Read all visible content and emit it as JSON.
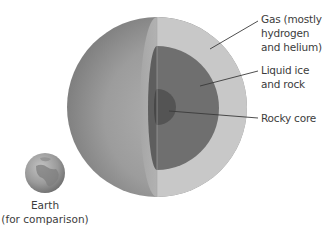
{
  "diagram": {
    "labels": {
      "gas": [
        "Gas (mostly",
        "hydrogen",
        "and helium)"
      ],
      "liquid": [
        "Liquid ice",
        "and rock"
      ],
      "core": [
        "Rocky core"
      ],
      "earth": [
        "Earth",
        "(for comparison)"
      ]
    },
    "layers": [
      {
        "name": "Gas (mostly hydrogen and helium)",
        "color": "#c8c8c8"
      },
      {
        "name": "Liquid ice and rock",
        "color": "#6f6f6f"
      },
      {
        "name": "Rocky core",
        "color": "#545454"
      }
    ],
    "colors": {
      "surface_dark": "#6e6e6e",
      "surface_mid": "#9a9a9a",
      "surface_light": "#b4b4b4",
      "leader_line": "#3a3a3a"
    }
  }
}
